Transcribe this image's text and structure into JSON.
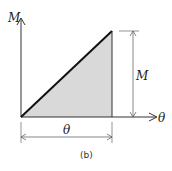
{
  "diagram": {
    "y_axis_label": "M",
    "x_axis_label": "θ",
    "vertical_dimension_label": "M",
    "horizontal_dimension_label": "θ",
    "caption": "(b)",
    "fill_color": "#d9d9d9",
    "line_color": "#222222"
  }
}
